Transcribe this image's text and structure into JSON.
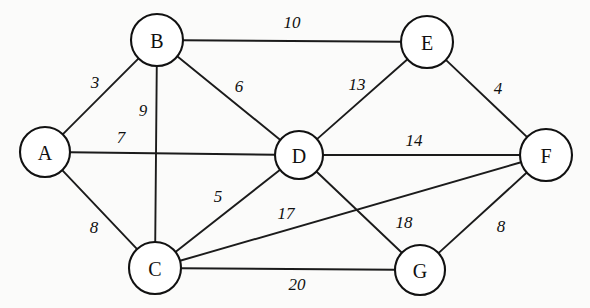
{
  "diagram": {
    "type": "node-link-graph",
    "background_color": "#fbfbfa",
    "node_fill_color": "#ffffff",
    "node_stroke_color": "#111111",
    "edge_color": "#1b1b1b",
    "label_color": "#101010"
  },
  "nodes": [
    {
      "id": "A",
      "label": "A",
      "x": 45,
      "y": 152,
      "r": 25
    },
    {
      "id": "B",
      "label": "B",
      "x": 157,
      "y": 40,
      "r": 26
    },
    {
      "id": "C",
      "label": "C",
      "x": 155,
      "y": 268,
      "r": 26
    },
    {
      "id": "D",
      "label": "D",
      "x": 299,
      "y": 155,
      "r": 24
    },
    {
      "id": "E",
      "label": "E",
      "x": 427,
      "y": 42,
      "r": 26
    },
    {
      "id": "F",
      "label": "F",
      "x": 546,
      "y": 155,
      "r": 26
    },
    {
      "id": "G",
      "label": "G",
      "x": 420,
      "y": 270,
      "r": 25
    }
  ],
  "edges": [
    {
      "source": "A",
      "target": "B",
      "weight": "3",
      "label_x": 95,
      "label_y": 82
    },
    {
      "source": "A",
      "target": "D",
      "weight": "7",
      "label_x": 121,
      "label_y": 137
    },
    {
      "source": "A",
      "target": "C",
      "weight": "8",
      "label_x": 94,
      "label_y": 227
    },
    {
      "source": "B",
      "target": "E",
      "weight": "10",
      "label_x": 292,
      "label_y": 22
    },
    {
      "source": "B",
      "target": "C",
      "weight": "9",
      "label_x": 143,
      "label_y": 110
    },
    {
      "source": "B",
      "target": "D",
      "weight": "6",
      "label_x": 239,
      "label_y": 86
    },
    {
      "source": "D",
      "target": "E",
      "weight": "13",
      "label_x": 357,
      "label_y": 84
    },
    {
      "source": "E",
      "target": "F",
      "weight": "4",
      "label_x": 498,
      "label_y": 88
    },
    {
      "source": "D",
      "target": "F",
      "weight": "14",
      "label_x": 414,
      "label_y": 140
    },
    {
      "source": "C",
      "target": "D",
      "weight": "5",
      "label_x": 218,
      "label_y": 196
    },
    {
      "source": "C",
      "target": "F",
      "weight": "17",
      "label_x": 286,
      "label_y": 213
    },
    {
      "source": "D",
      "target": "G",
      "weight": "18",
      "label_x": 404,
      "label_y": 222
    },
    {
      "source": "C",
      "target": "G",
      "weight": "20",
      "label_x": 297,
      "label_y": 284
    },
    {
      "source": "F",
      "target": "G",
      "weight": "8",
      "label_x": 501,
      "label_y": 226
    }
  ]
}
